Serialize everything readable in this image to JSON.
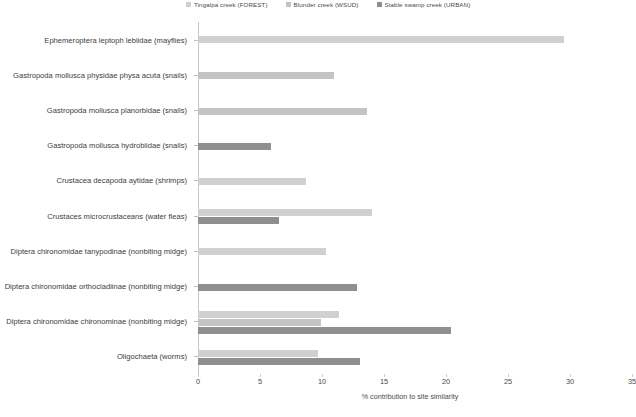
{
  "chart_data": {
    "type": "bar",
    "orientation": "horizontal",
    "title": "",
    "xlabel": "% contribution to site similarity",
    "ylabel": "",
    "xlim": [
      0,
      35
    ],
    "xticks": [
      0,
      5,
      10,
      15,
      20,
      25,
      30,
      35
    ],
    "grid": false,
    "legend_position": "top",
    "categories": [
      "Ephemeroptera leptoph lebiidae (mayflies)",
      "Gastropoda mollusca physidae physa acuta (snails)",
      "Gastropoda mollusca planorbidae (snails)",
      "Gastropoda mollusca hydrobiidae (snails)",
      "Crustacea decapoda aytidae (shrimps)",
      "Crustaces microcrustaceans (water fleas)",
      "Diptera chironomidae tanypodinae (nonbiting midge)",
      "Diptera chironomidae orthocladiinae (nonbiting midge)",
      "Diptera chironomidae chironominae (nonbiting midge)",
      "Oligochaeta (worms)"
    ],
    "series": [
      {
        "name": "Tingalpa creek (FOREST)",
        "color": "#d0d0d0",
        "values": [
          29.5,
          0,
          0,
          0,
          8.7,
          14.0,
          10.3,
          0,
          11.4,
          9.7
        ]
      },
      {
        "name": "Blunder creek (WSUD)",
        "color": "#c4c4c4",
        "values": [
          0,
          11.0,
          13.6,
          0,
          0,
          0,
          0,
          0,
          9.9,
          0
        ]
      },
      {
        "name": "Stable swamp creek (URBAN)",
        "color": "#8f8f8f",
        "values": [
          0,
          0,
          0,
          5.9,
          0,
          6.5,
          0,
          12.8,
          20.4,
          13.1
        ]
      }
    ]
  },
  "caption": {
    "text": ""
  }
}
